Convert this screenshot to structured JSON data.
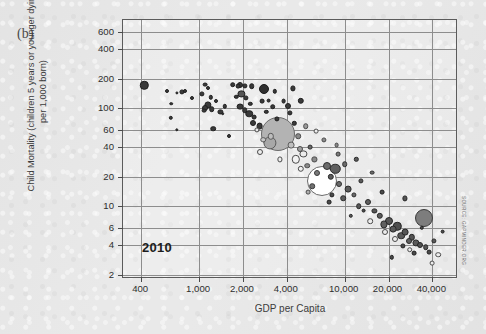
{
  "figure": {
    "panel_label": "(b)",
    "year_annotation": "2010",
    "source_note": "SOURCE: GAPMINDER.ORG"
  },
  "chart_data": {
    "type": "scatter",
    "title": "",
    "subtitle": "",
    "xlabel": "GDP per Capita",
    "ylabel": "Child Mortality (children 5 years or younger dying per 1,000 born)",
    "xscale": "log",
    "yscale": "log",
    "xlim": [
      300,
      60000
    ],
    "ylim": [
      1.8,
      800
    ],
    "grid": true,
    "legend": "none",
    "annotations": [
      "2010"
    ],
    "xticks": [
      400,
      1000,
      2000,
      4000,
      10000,
      20000,
      40000
    ],
    "xtick_labels": [
      "400",
      "1,000",
      "2,000",
      "4,000",
      "10,000",
      "20,000",
      "40,000"
    ],
    "yticks": [
      600,
      400,
      200,
      100,
      60,
      40,
      20,
      10,
      6,
      4,
      2
    ],
    "ytick_labels": [
      "600",
      "400",
      "200",
      "100",
      "60",
      "40",
      "20",
      "10",
      "6",
      "4",
      "2"
    ],
    "bubble_size_encodes": "population",
    "points": [
      {
        "x": 420,
        "y": 172,
        "r": 4.2,
        "fill": "#3a3a3a",
        "stroke": "#1f1f1f"
      },
      {
        "x": 600,
        "y": 152,
        "r": 2.0,
        "fill": "#3a3a3a",
        "stroke": "#1f1f1f"
      },
      {
        "x": 700,
        "y": 145,
        "r": 1.6,
        "fill": "#3a3a3a",
        "stroke": "#1f1f1f"
      },
      {
        "x": 760,
        "y": 148,
        "r": 2.6,
        "fill": "#3a3a3a",
        "stroke": "#1f1f1f"
      },
      {
        "x": 800,
        "y": 150,
        "r": 2.0,
        "fill": "#3a3a3a",
        "stroke": "#1f1f1f"
      },
      {
        "x": 640,
        "y": 112,
        "r": 1.8,
        "fill": "#3a3a3a",
        "stroke": "#1f1f1f"
      },
      {
        "x": 640,
        "y": 80,
        "r": 2.2,
        "fill": "#3a3a3a",
        "stroke": "#1f1f1f"
      },
      {
        "x": 700,
        "y": 60,
        "r": 1.7,
        "fill": "#3a3a3a",
        "stroke": "#1f1f1f"
      },
      {
        "x": 1100,
        "y": 175,
        "r": 2.4,
        "fill": "#3a3a3a",
        "stroke": "#1f1f1f"
      },
      {
        "x": 1150,
        "y": 160,
        "r": 2.0,
        "fill": "#3a3a3a",
        "stroke": "#1f1f1f"
      },
      {
        "x": 1050,
        "y": 140,
        "r": 2.6,
        "fill": "#3a3a3a",
        "stroke": "#1f1f1f"
      },
      {
        "x": 1200,
        "y": 130,
        "r": 2.2,
        "fill": "#3a3a3a",
        "stroke": "#1f1f1f"
      },
      {
        "x": 1150,
        "y": 108,
        "r": 3.6,
        "fill": "#3a3a3a",
        "stroke": "#1f1f1f"
      },
      {
        "x": 1100,
        "y": 100,
        "r": 3.0,
        "fill": "#3a3a3a",
        "stroke": "#1f1f1f"
      },
      {
        "x": 1220,
        "y": 98,
        "r": 2.8,
        "fill": "#3a3a3a",
        "stroke": "#1f1f1f"
      },
      {
        "x": 1080,
        "y": 95,
        "r": 2.4,
        "fill": "#3a3a3a",
        "stroke": "#1f1f1f"
      },
      {
        "x": 1300,
        "y": 118,
        "r": 2.0,
        "fill": "#3a3a3a",
        "stroke": "#1f1f1f"
      },
      {
        "x": 1400,
        "y": 92,
        "r": 2.6,
        "fill": "#3a3a3a",
        "stroke": "#1f1f1f"
      },
      {
        "x": 1500,
        "y": 105,
        "r": 2.2,
        "fill": "#3a3a3a",
        "stroke": "#1f1f1f"
      },
      {
        "x": 1250,
        "y": 62,
        "r": 2.8,
        "fill": "#3a3a3a",
        "stroke": "#1f1f1f"
      },
      {
        "x": 1450,
        "y": 88,
        "r": 1.8,
        "fill": "#3a3a3a",
        "stroke": "#1f1f1f"
      },
      {
        "x": 1700,
        "y": 175,
        "r": 2.8,
        "fill": "#3a3a3a",
        "stroke": "#1f1f1f"
      },
      {
        "x": 1850,
        "y": 168,
        "r": 2.4,
        "fill": "#3a3a3a",
        "stroke": "#1f1f1f"
      },
      {
        "x": 1900,
        "y": 172,
        "r": 3.0,
        "fill": "#3a3a3a",
        "stroke": "#1f1f1f"
      },
      {
        "x": 2050,
        "y": 170,
        "r": 2.6,
        "fill": "#3a3a3a",
        "stroke": "#1f1f1f"
      },
      {
        "x": 2300,
        "y": 168,
        "r": 2.8,
        "fill": "#3a3a3a",
        "stroke": "#1f1f1f"
      },
      {
        "x": 1950,
        "y": 140,
        "r": 3.6,
        "fill": "#555555",
        "stroke": "#1f1f1f"
      },
      {
        "x": 1800,
        "y": 132,
        "r": 2.2,
        "fill": "#3a3a3a",
        "stroke": "#1f1f1f"
      },
      {
        "x": 2100,
        "y": 128,
        "r": 2.6,
        "fill": "#3a3a3a",
        "stroke": "#1f1f1f"
      },
      {
        "x": 2250,
        "y": 112,
        "r": 2.2,
        "fill": "#3a3a3a",
        "stroke": "#1f1f1f"
      },
      {
        "x": 1900,
        "y": 104,
        "r": 3.4,
        "fill": "#3a3a3a",
        "stroke": "#1f1f1f"
      },
      {
        "x": 2050,
        "y": 96,
        "r": 2.8,
        "fill": "#3a3a3a",
        "stroke": "#1f1f1f"
      },
      {
        "x": 2200,
        "y": 88,
        "r": 3.8,
        "fill": "#3a3a3a",
        "stroke": "#1f1f1f"
      },
      {
        "x": 2400,
        "y": 82,
        "r": 2.4,
        "fill": "#3a3a3a",
        "stroke": "#1f1f1f"
      },
      {
        "x": 2350,
        "y": 70,
        "r": 3.0,
        "fill": "#3a3a3a",
        "stroke": "#1f1f1f"
      },
      {
        "x": 2600,
        "y": 66,
        "r": 3.4,
        "fill": "#3a3a3a",
        "stroke": "#1f1f1f"
      },
      {
        "x": 2500,
        "y": 60,
        "r": 2.6,
        "fill": "#e8e8e8",
        "stroke": "#4a4a4a"
      },
      {
        "x": 2800,
        "y": 158,
        "r": 5.0,
        "fill": "#2f2f2f",
        "stroke": "#1a1a1a"
      },
      {
        "x": 3000,
        "y": 120,
        "r": 2.4,
        "fill": "#3a3a3a",
        "stroke": "#1f1f1f"
      },
      {
        "x": 3200,
        "y": 104,
        "r": 2.8,
        "fill": "#3a3a3a",
        "stroke": "#1f1f1f"
      },
      {
        "x": 2900,
        "y": 92,
        "r": 2.2,
        "fill": "#3a3a3a",
        "stroke": "#1f1f1f"
      },
      {
        "x": 3400,
        "y": 78,
        "r": 2.6,
        "fill": "#3a3a3a",
        "stroke": "#1f1f1f"
      },
      {
        "x": 3100,
        "y": 52,
        "r": 3.2,
        "fill": "#bdbdbd",
        "stroke": "#5a5a5a"
      },
      {
        "x": 2750,
        "y": 48,
        "r": 2.8,
        "fill": "#c8c8c8",
        "stroke": "#5a5a5a"
      },
      {
        "x": 3050,
        "y": 44,
        "r": 6.6,
        "fill": "#a8a8a8",
        "stroke": "#5a5a5a"
      },
      {
        "x": 3500,
        "y": 55,
        "r": 17.0,
        "fill": "#b3b3b3",
        "stroke": "#6a6a6a"
      },
      {
        "x": 2600,
        "y": 36,
        "r": 3.0,
        "fill": "#ededed",
        "stroke": "#4a4a4a"
      },
      {
        "x": 3600,
        "y": 30,
        "r": 2.6,
        "fill": "#ededed",
        "stroke": "#4a4a4a"
      },
      {
        "x": 4200,
        "y": 90,
        "r": 2.6,
        "fill": "#3a3a3a",
        "stroke": "#1f1f1f"
      },
      {
        "x": 4500,
        "y": 70,
        "r": 2.2,
        "fill": "#3a3a3a",
        "stroke": "#1f1f1f"
      },
      {
        "x": 4800,
        "y": 52,
        "r": 2.8,
        "fill": "#8a8a8a",
        "stroke": "#4a4a4a"
      },
      {
        "x": 4300,
        "y": 42,
        "r": 3.4,
        "fill": "#c0c0c0",
        "stroke": "#5a5a5a"
      },
      {
        "x": 4900,
        "y": 38,
        "r": 3.0,
        "fill": "#a0a0a0",
        "stroke": "#4a4a4a"
      },
      {
        "x": 4600,
        "y": 30,
        "r": 4.2,
        "fill": "#f2f2f2",
        "stroke": "#4a4a4a"
      },
      {
        "x": 5200,
        "y": 34,
        "r": 3.6,
        "fill": "#ededed",
        "stroke": "#4a4a4a"
      },
      {
        "x": 5500,
        "y": 26,
        "r": 2.8,
        "fill": "#8a8a8a",
        "stroke": "#4a4a4a"
      },
      {
        "x": 5000,
        "y": 24,
        "r": 3.2,
        "fill": "#f2f2f2",
        "stroke": "#4a4a4a"
      },
      {
        "x": 5800,
        "y": 40,
        "r": 2.4,
        "fill": "#6a6a6a",
        "stroke": "#2f2f2f"
      },
      {
        "x": 6200,
        "y": 30,
        "r": 2.6,
        "fill": "#8a8a8a",
        "stroke": "#4a4a4a"
      },
      {
        "x": 6500,
        "y": 22,
        "r": 3.0,
        "fill": "#7a7a7a",
        "stroke": "#3a3a3a"
      },
      {
        "x": 7000,
        "y": 18,
        "r": 15.0,
        "fill": "#ffffff",
        "stroke": "#6a6a6a"
      },
      {
        "x": 6000,
        "y": 16,
        "r": 2.8,
        "fill": "#707070",
        "stroke": "#3a3a3a"
      },
      {
        "x": 5600,
        "y": 14,
        "r": 2.4,
        "fill": "#b0b0b0",
        "stroke": "#4a4a4a"
      },
      {
        "x": 7500,
        "y": 26,
        "r": 4.0,
        "fill": "#6a6a6a",
        "stroke": "#2f2f2f"
      },
      {
        "x": 8000,
        "y": 20,
        "r": 3.2,
        "fill": "#5a5a5a",
        "stroke": "#2a2a2a"
      },
      {
        "x": 8600,
        "y": 24,
        "r": 5.2,
        "fill": "#5f5f5f",
        "stroke": "#2a2a2a"
      },
      {
        "x": 9200,
        "y": 17,
        "r": 3.0,
        "fill": "#6a6a6a",
        "stroke": "#2f2f2f"
      },
      {
        "x": 8200,
        "y": 13,
        "r": 2.6,
        "fill": "#4a4a4a",
        "stroke": "#222222"
      },
      {
        "x": 9800,
        "y": 12,
        "r": 2.8,
        "fill": "#5a5a5a",
        "stroke": "#2a2a2a"
      },
      {
        "x": 7800,
        "y": 11,
        "r": 2.4,
        "fill": "#4a4a4a",
        "stroke": "#222222"
      },
      {
        "x": 10500,
        "y": 15,
        "r": 3.4,
        "fill": "#5a5a5a",
        "stroke": "#2a2a2a"
      },
      {
        "x": 11500,
        "y": 13,
        "r": 2.6,
        "fill": "#6a6a6a",
        "stroke": "#2f2f2f"
      },
      {
        "x": 12500,
        "y": 10,
        "r": 2.8,
        "fill": "#555555",
        "stroke": "#262626"
      },
      {
        "x": 13500,
        "y": 9,
        "r": 2.4,
        "fill": "#4a4a4a",
        "stroke": "#222222"
      },
      {
        "x": 11000,
        "y": 8,
        "r": 2.2,
        "fill": "#5a5a5a",
        "stroke": "#2a2a2a"
      },
      {
        "x": 14500,
        "y": 11,
        "r": 3.0,
        "fill": "#606060",
        "stroke": "#2a2a2a"
      },
      {
        "x": 16000,
        "y": 9,
        "r": 2.6,
        "fill": "#555555",
        "stroke": "#262626"
      },
      {
        "x": 15000,
        "y": 7,
        "r": 2.8,
        "fill": "#ededed",
        "stroke": "#4a4a4a"
      },
      {
        "x": 17500,
        "y": 8,
        "r": 3.2,
        "fill": "#5a5a5a",
        "stroke": "#2a2a2a"
      },
      {
        "x": 18500,
        "y": 6.5,
        "r": 3.6,
        "fill": "#606060",
        "stroke": "#2a2a2a"
      },
      {
        "x": 20000,
        "y": 7,
        "r": 4.0,
        "fill": "#555555",
        "stroke": "#262626"
      },
      {
        "x": 19000,
        "y": 5.5,
        "r": 3.0,
        "fill": "#ededed",
        "stroke": "#4a4a4a"
      },
      {
        "x": 21500,
        "y": 5.8,
        "r": 3.4,
        "fill": "#5a5a5a",
        "stroke": "#2a2a2a"
      },
      {
        "x": 23000,
        "y": 6.2,
        "r": 4.2,
        "fill": "#4f4f4f",
        "stroke": "#242424"
      },
      {
        "x": 24500,
        "y": 5.0,
        "r": 3.8,
        "fill": "#5a5a5a",
        "stroke": "#2a2a2a"
      },
      {
        "x": 22000,
        "y": 4.6,
        "r": 3.0,
        "fill": "#f0f0f0",
        "stroke": "#4a4a4a"
      },
      {
        "x": 26000,
        "y": 5.4,
        "r": 3.4,
        "fill": "#555555",
        "stroke": "#262626"
      },
      {
        "x": 27500,
        "y": 4.4,
        "r": 3.0,
        "fill": "#606060",
        "stroke": "#2a2a2a"
      },
      {
        "x": 25000,
        "y": 3.9,
        "r": 2.6,
        "fill": "#4a4a4a",
        "stroke": "#222222"
      },
      {
        "x": 29000,
        "y": 4.8,
        "r": 3.2,
        "fill": "#545454",
        "stroke": "#262626"
      },
      {
        "x": 31000,
        "y": 4.2,
        "r": 3.6,
        "fill": "#5a5a5a",
        "stroke": "#2a2a2a"
      },
      {
        "x": 28000,
        "y": 3.6,
        "r": 2.8,
        "fill": "#ededed",
        "stroke": "#4a4a4a"
      },
      {
        "x": 33000,
        "y": 4.0,
        "r": 3.0,
        "fill": "#505050",
        "stroke": "#242424"
      },
      {
        "x": 30000,
        "y": 3.3,
        "r": 2.4,
        "fill": "#4a4a4a",
        "stroke": "#222222"
      },
      {
        "x": 35000,
        "y": 7.5,
        "r": 9.0,
        "fill": "#7d7d7d",
        "stroke": "#3a3a3a"
      },
      {
        "x": 36000,
        "y": 3.8,
        "r": 2.8,
        "fill": "#555555",
        "stroke": "#262626"
      },
      {
        "x": 38000,
        "y": 3.4,
        "r": 2.4,
        "fill": "#4a4a4a",
        "stroke": "#222222"
      },
      {
        "x": 41000,
        "y": 4.4,
        "r": 2.6,
        "fill": "#5a5a5a",
        "stroke": "#2a2a2a"
      },
      {
        "x": 44000,
        "y": 3.2,
        "r": 2.8,
        "fill": "#ededed",
        "stroke": "#4a4a4a"
      },
      {
        "x": 47000,
        "y": 5.5,
        "r": 2.4,
        "fill": "#4a4a4a",
        "stroke": "#222222"
      },
      {
        "x": 18000,
        "y": 14,
        "r": 2.4,
        "fill": "#4a4a4a",
        "stroke": "#222222"
      },
      {
        "x": 13000,
        "y": 18,
        "r": 2.6,
        "fill": "#5a5a5a",
        "stroke": "#2a2a2a"
      },
      {
        "x": 10000,
        "y": 27,
        "r": 2.8,
        "fill": "#6a6a6a",
        "stroke": "#2f2f2f"
      },
      {
        "x": 9000,
        "y": 34,
        "r": 2.4,
        "fill": "#7a7a7a",
        "stroke": "#3a3a3a"
      },
      {
        "x": 12000,
        "y": 30,
        "r": 2.2,
        "fill": "#5a5a5a",
        "stroke": "#2a2a2a"
      },
      {
        "x": 7200,
        "y": 48,
        "r": 2.6,
        "fill": "#8a8a8a",
        "stroke": "#4a4a4a"
      },
      {
        "x": 6400,
        "y": 58,
        "r": 2.4,
        "fill": "#ededed",
        "stroke": "#4a4a4a"
      },
      {
        "x": 5400,
        "y": 66,
        "r": 2.8,
        "fill": "#9a9a9a",
        "stroke": "#4a4a4a"
      },
      {
        "x": 4100,
        "y": 105,
        "r": 3.0,
        "fill": "#3a3a3a",
        "stroke": "#1f1f1f"
      },
      {
        "x": 3800,
        "y": 118,
        "r": 2.4,
        "fill": "#3a3a3a",
        "stroke": "#1f1f1f"
      },
      {
        "x": 5000,
        "y": 120,
        "r": 3.2,
        "fill": "#3a3a3a",
        "stroke": "#1f1f1f"
      },
      {
        "x": 4400,
        "y": 160,
        "r": 2.6,
        "fill": "#3a3a3a",
        "stroke": "#1f1f1f"
      },
      {
        "x": 3300,
        "y": 150,
        "r": 2.2,
        "fill": "#3a3a3a",
        "stroke": "#1f1f1f"
      },
      {
        "x": 2700,
        "y": 118,
        "r": 2.4,
        "fill": "#3a3a3a",
        "stroke": "#1f1f1f"
      },
      {
        "x": 15500,
        "y": 22,
        "r": 2.4,
        "fill": "#6a6a6a",
        "stroke": "#2f2f2f"
      },
      {
        "x": 26000,
        "y": 12,
        "r": 2.6,
        "fill": "#555555",
        "stroke": "#262626"
      },
      {
        "x": 34000,
        "y": 6.0,
        "r": 2.2,
        "fill": "#4a4a4a",
        "stroke": "#222222"
      },
      {
        "x": 40000,
        "y": 2.6,
        "r": 2.4,
        "fill": "#ededed",
        "stroke": "#4a4a4a"
      },
      {
        "x": 21000,
        "y": 3.0,
        "r": 2.2,
        "fill": "#4a4a4a",
        "stroke": "#222222"
      },
      {
        "x": 8800,
        "y": 42,
        "r": 2.4,
        "fill": "#8a8a8a",
        "stroke": "#4a4a4a"
      },
      {
        "x": 1600,
        "y": 52,
        "r": 2.0,
        "fill": "#3a3a3a",
        "stroke": "#1f1f1f"
      },
      {
        "x": 900,
        "y": 128,
        "r": 2.0,
        "fill": "#3a3a3a",
        "stroke": "#1f1f1f"
      }
    ]
  }
}
